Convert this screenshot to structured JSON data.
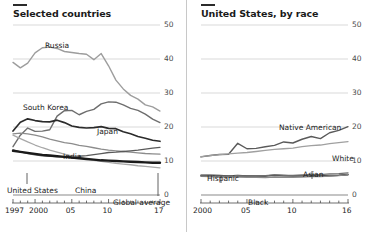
{
  "panels": [
    {
      "id": "selected-countries",
      "title": "Selected countries",
      "axis": {
        "ylabels": [
          "50",
          "40",
          "30",
          "20",
          "10",
          "0"
        ],
        "xlabels": [
          "1997",
          "2000",
          "05",
          "10",
          "17"
        ]
      },
      "series_labels": [
        {
          "text": "Russia",
          "x": 45,
          "y": 41
        },
        {
          "text": "South Korea",
          "x": 23,
          "y": 103
        },
        {
          "text": "Japan",
          "x": 97,
          "y": 127
        },
        {
          "text": "India",
          "x": 63,
          "y": 152
        },
        {
          "text": "United States",
          "x": 7,
          "y": 186
        },
        {
          "text": "China",
          "x": 75,
          "y": 186
        },
        {
          "text": "Global average",
          "x": 113,
          "y": 198
        }
      ]
    },
    {
      "id": "united-states-by-race",
      "title": "United States, by race",
      "axis": {
        "ylabels": [
          "50",
          "40",
          "30",
          "20",
          "10",
          "0"
        ],
        "xlabels": [
          "2000",
          "05",
          "10",
          "16"
        ]
      },
      "series_labels": [
        {
          "text": "Native American",
          "x": 91,
          "y": 123
        },
        {
          "text": "White",
          "x": 144,
          "y": 154
        },
        {
          "text": "Hispanic",
          "x": 19,
          "y": 174
        },
        {
          "text": "Asian",
          "x": 115,
          "y": 170
        },
        {
          "text": "Black",
          "x": 60,
          "y": 198
        }
      ]
    }
  ],
  "chart_data": [
    {
      "type": "line",
      "title": "Selected countries",
      "xlabel": "",
      "ylabel": "",
      "xlim": [
        1997,
        2017
      ],
      "ylim": [
        0,
        50
      ],
      "yticks": [
        0,
        10,
        20,
        30,
        40,
        50
      ],
      "xticks": [
        1997,
        2000,
        2005,
        2010,
        2017
      ],
      "grid": true,
      "legend": "inline-labels",
      "x": [
        1997,
        1998,
        1999,
        2000,
        2001,
        2002,
        2003,
        2004,
        2005,
        2006,
        2007,
        2008,
        2009,
        2010,
        2011,
        2012,
        2013,
        2014,
        2015,
        2016,
        2017
      ],
      "series": [
        {
          "name": "Russia",
          "color": "#9d9d9d",
          "width": 1.4,
          "values": [
            39.0,
            37.4,
            38.8,
            41.8,
            43.3,
            43.5,
            43.1,
            42.2,
            41.9,
            41.6,
            41.4,
            39.8,
            41.6,
            38.0,
            33.8,
            31.2,
            29.3,
            28.2,
            26.5,
            25.9,
            24.7
          ]
        },
        {
          "name": "South Korea",
          "color": "#6e6e6e",
          "width": 1.4,
          "values": [
            14.2,
            17.6,
            19.7,
            18.7,
            18.8,
            19.2,
            23.2,
            24.8,
            24.9,
            23.6,
            24.6,
            25.2,
            26.8,
            27.4,
            27.3,
            26.5,
            25.5,
            24.9,
            23.8,
            22.3,
            21.3
          ]
        },
        {
          "name": "Japan",
          "color": "#2b2b2b",
          "width": 1.7,
          "values": [
            18.8,
            21.4,
            22.4,
            21.9,
            21.6,
            21.5,
            22.0,
            21.3,
            20.3,
            19.9,
            19.7,
            19.8,
            20.1,
            19.6,
            19.5,
            18.6,
            18.0,
            17.2,
            16.7,
            16.1,
            15.8
          ]
        },
        {
          "name": "India",
          "color": "#8c8c8c",
          "width": 1.3,
          "values": [
            18.0,
            18.2,
            18.0,
            17.6,
            17.1,
            16.4,
            15.9,
            15.4,
            15.1,
            14.6,
            14.3,
            13.9,
            13.5,
            13.2,
            13.0,
            12.8,
            12.6,
            12.4,
            12.2,
            12.1,
            12.0
          ]
        },
        {
          "name": "United States",
          "color": "#5a5a5a",
          "width": 1.3,
          "values": [
            13.3,
            12.7,
            12.2,
            11.8,
            11.5,
            11.4,
            11.3,
            11.3,
            11.3,
            11.4,
            11.6,
            11.9,
            12.2,
            12.5,
            12.6,
            12.8,
            13.0,
            13.2,
            13.5,
            13.8,
            14.0
          ]
        },
        {
          "name": "China",
          "color": "#a8a8a8",
          "width": 1.3,
          "values": [
            17.6,
            16.6,
            15.6,
            14.7,
            13.9,
            13.2,
            12.6,
            12.0,
            11.5,
            11.0,
            10.6,
            10.2,
            9.9,
            9.6,
            9.3,
            9.1,
            8.9,
            8.6,
            8.4,
            8.2,
            8.0
          ]
        },
        {
          "name": "Global average",
          "color": "#1a1a1a",
          "width": 2.4,
          "values": [
            13.0,
            12.7,
            12.4,
            12.1,
            11.8,
            11.6,
            11.4,
            11.2,
            11.0,
            10.8,
            10.6,
            10.4,
            10.2,
            10.1,
            10.0,
            9.9,
            9.8,
            9.7,
            9.6,
            9.5,
            9.5
          ]
        }
      ]
    },
    {
      "type": "line",
      "title": "United States, by race",
      "xlabel": "",
      "ylabel": "",
      "xlim": [
        2000,
        2016
      ],
      "ylim": [
        0,
        50
      ],
      "yticks": [
        0,
        10,
        20,
        30,
        40,
        50
      ],
      "xticks": [
        2000,
        2005,
        2010,
        2016
      ],
      "grid": true,
      "legend": "inline-labels",
      "x": [
        2000,
        2001,
        2002,
        2003,
        2004,
        2005,
        2006,
        2007,
        2008,
        2009,
        2010,
        2011,
        2012,
        2013,
        2014,
        2015,
        2016
      ],
      "series": [
        {
          "name": "Native American",
          "color": "#5a5a5a",
          "width": 1.4,
          "values": [
            11.2,
            11.6,
            11.9,
            12.0,
            15.2,
            13.6,
            13.7,
            14.2,
            14.6,
            15.6,
            15.3,
            16.4,
            17.2,
            16.6,
            18.3,
            19.0,
            20.1
          ]
        },
        {
          "name": "White",
          "color": "#a0a0a0",
          "width": 1.3,
          "values": [
            11.3,
            11.6,
            11.9,
            12.1,
            12.3,
            12.5,
            12.8,
            13.1,
            13.4,
            13.6,
            13.8,
            14.2,
            14.5,
            14.7,
            15.1,
            15.4,
            15.7
          ]
        },
        {
          "name": "Hispanic",
          "color": "#2b2b2b",
          "width": 1.6,
          "values": [
            5.8,
            5.8,
            5.7,
            5.6,
            5.7,
            5.6,
            5.6,
            5.6,
            5.8,
            5.7,
            5.6,
            5.6,
            5.6,
            5.6,
            5.7,
            5.8,
            6.0
          ]
        },
        {
          "name": "Black",
          "color": "#8a8a8a",
          "width": 1.4,
          "values": [
            5.5,
            5.4,
            5.3,
            5.3,
            5.3,
            5.2,
            5.2,
            5.1,
            5.3,
            5.2,
            5.2,
            5.3,
            5.4,
            5.4,
            5.6,
            5.7,
            6.0
          ]
        },
        {
          "name": "Asian",
          "color": "#6e6e6e",
          "width": 1.3,
          "values": [
            5.6,
            5.6,
            5.6,
            5.6,
            5.7,
            5.6,
            5.7,
            5.7,
            5.9,
            5.8,
            5.8,
            5.9,
            6.0,
            6.0,
            6.2,
            6.3,
            6.5
          ]
        }
      ]
    }
  ]
}
